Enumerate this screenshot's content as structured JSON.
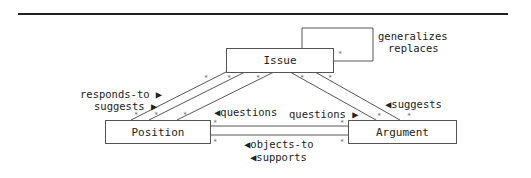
{
  "diagram": {
    "nodes": {
      "issue": {
        "label": "Issue"
      },
      "position": {
        "label": "Position"
      },
      "argument": {
        "label": "Argument"
      }
    },
    "labels": {
      "self_loop": [
        "generalizes",
        "replaces"
      ],
      "position_to_issue": [
        "responds-to ▶",
        "suggests ▶"
      ],
      "argument_to_issue": "◀suggests",
      "position_questions": "◀questions",
      "argument_questions": "questions ▶",
      "argument_to_position": [
        "◀objects-to",
        "◀supports"
      ]
    },
    "multiplicity": "*"
  }
}
